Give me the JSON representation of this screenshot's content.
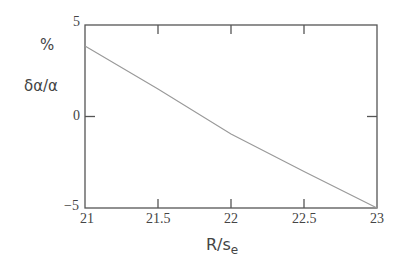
{
  "chart_data": {
    "type": "line",
    "title": "",
    "xlabel": "R/s",
    "xlabel_subscript": "e",
    "ylabel": "δα/α",
    "ylabel_unit": "%",
    "xlim": [
      21,
      23
    ],
    "ylim": [
      -5,
      5
    ],
    "x_ticks": [
      "21",
      "21.5",
      "22",
      "22.5",
      "23"
    ],
    "y_ticks": [
      "5",
      "0",
      "-5"
    ],
    "grid": false,
    "legend": null,
    "series": [
      {
        "name": "δα/α",
        "x": [
          21,
          21.5,
          22,
          22.5,
          23
        ],
        "values": [
          3.85,
          1.5,
          -0.95,
          -3.0,
          -5.0
        ]
      }
    ]
  },
  "labels": {
    "y_unit": "%",
    "y_axis": "δα/α",
    "x_axis": "R/s",
    "x_axis_sub": "e",
    "y_tick_top": "5",
    "y_tick_mid": "0",
    "y_tick_bottom": "−5",
    "x_tick_0": "21",
    "x_tick_1": "21.5",
    "x_tick_2": "22",
    "x_tick_3": "22.5",
    "x_tick_4": "23"
  }
}
